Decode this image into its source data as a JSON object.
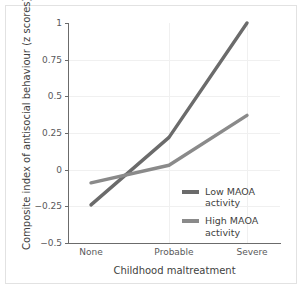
{
  "chart_data": {
    "type": "line",
    "title": "",
    "xlabel": "Childhood maltreatment",
    "ylabel": "Composite index of antisocial behaviour (z scores)",
    "categories": [
      "None",
      "Probable",
      "Severe"
    ],
    "ylim": [
      -0.5,
      1
    ],
    "yticks": [
      "1",
      "0.75",
      "0.5",
      "0.25",
      "0",
      "−0.25",
      "−0.5"
    ],
    "ytick_values": [
      1,
      0.75,
      0.5,
      0.25,
      0,
      -0.25,
      -0.5
    ],
    "grid": true,
    "legend_position": "center-right-inside",
    "series": [
      {
        "name": "Low MAOA\nactivity",
        "color": "#6b6b6b",
        "values": [
          -0.24,
          0.22,
          1.0
        ]
      },
      {
        "name": "High MAOA\nactivity",
        "color": "#8a8a8a",
        "values": [
          -0.09,
          0.03,
          0.37
        ]
      }
    ]
  },
  "axes": {
    "y_title": "Composite index of antisocial behaviour (z scores)",
    "x_title": "Childhood maltreatment"
  },
  "legend": {
    "items": [
      {
        "label": "Low MAOA\nactivity",
        "color": "#6b6b6b"
      },
      {
        "label": "High MAOA\nactivity",
        "color": "#8a8a8a"
      }
    ]
  }
}
